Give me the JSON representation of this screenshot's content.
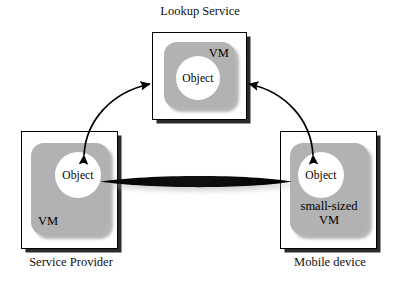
{
  "diagram": {
    "nodes": {
      "lookup_service": {
        "caption": "Lookup Service",
        "vm_label": "VM",
        "object_label": "Object"
      },
      "service_provider": {
        "caption": "Service Provider",
        "vm_label": "VM",
        "object_label": "Object"
      },
      "mobile_device": {
        "caption": "Mobile device",
        "vm_label": "small-sized\nVM",
        "object_label": "Object"
      }
    },
    "connectors": {
      "provider_to_lookup": "curved-double-arrow",
      "mobile_to_lookup": "curved-double-arrow",
      "provider_to_mobile": "thick-horizontal-double-arrow"
    },
    "colors": {
      "vm_fill": "#b2b2b2",
      "box_fill": "#ffffff",
      "stroke": "#000000",
      "shadow": "#2b2b2b",
      "object_fill": "#ffffff"
    }
  }
}
